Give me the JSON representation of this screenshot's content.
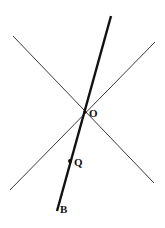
{
  "diagram": {
    "lines": [
      {
        "name": "thick-line-OB",
        "x1": 111,
        "y1": 16,
        "x2": 57,
        "y2": 211,
        "width": 2.4
      },
      {
        "name": "thin-line-1",
        "x1": 13,
        "y1": 36,
        "x2": 154,
        "y2": 183,
        "width": 0.9
      },
      {
        "name": "thin-line-2",
        "x1": 10,
        "y1": 190,
        "x2": 155,
        "y2": 42,
        "width": 0.9
      }
    ],
    "points": [
      {
        "name": "point-O",
        "label": "O",
        "x": 85,
        "y": 112
      },
      {
        "name": "point-Q",
        "label": "Q",
        "x": 70,
        "y": 161
      }
    ],
    "labels": {
      "O": "O",
      "Q": "Q",
      "B": "B"
    },
    "color": "#111111"
  }
}
